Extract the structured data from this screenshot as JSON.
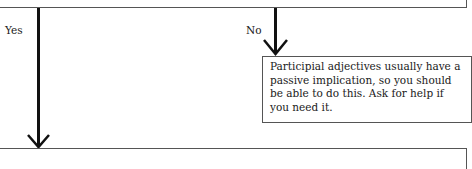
{
  "branches": {
    "yes_label": "Yes",
    "no_label": "No"
  },
  "note": {
    "text": "Participial adjectives usually have a passive implication, so you should be able to do this. Ask for help if you need it."
  },
  "colors": {
    "arrow": "#111111",
    "box_border": "#555555"
  }
}
